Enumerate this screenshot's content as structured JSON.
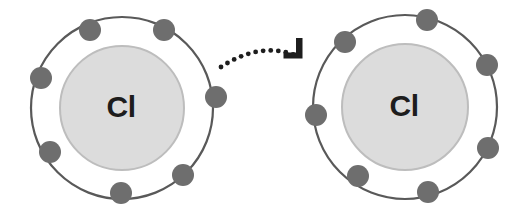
{
  "diagram": {
    "background_color": "#ffffff",
    "width": 532,
    "height": 218
  },
  "style": {
    "shell_stroke_color": "#595959",
    "shell_stroke_width": 2.2,
    "electron_fill_color": "#6e6e6e",
    "electron_radius": 11,
    "nucleus_fill_color": "#dcdcdc",
    "nucleus_stroke_color": "#bdbdbd",
    "nucleus_stroke_width": 2,
    "label_color": "#1d1d1d",
    "arrow_color": "#1d1d1d"
  },
  "atoms": [
    {
      "id": "atom-left",
      "name": "chlorine-atom-left",
      "element_symbol": "Cl",
      "element_name": "Chlorine",
      "center_x": 122,
      "center_y": 108,
      "shell_radius": 91,
      "nucleus_radius": 62,
      "valence_electron_count": 7,
      "electrons": [
        {
          "name": "electron-1",
          "x": 90,
          "y": 30
        },
        {
          "name": "electron-2",
          "x": 164,
          "y": 30
        },
        {
          "name": "electron-3",
          "x": 41,
          "y": 78
        },
        {
          "name": "electron-4",
          "x": 216,
          "y": 97
        },
        {
          "name": "electron-5",
          "x": 50,
          "y": 152
        },
        {
          "name": "electron-6",
          "x": 183,
          "y": 175
        },
        {
          "name": "electron-7",
          "x": 121,
          "y": 193
        }
      ]
    },
    {
      "id": "atom-right",
      "name": "chlorine-atom-right",
      "element_symbol": "Cl",
      "element_name": "Chlorine",
      "center_x": 405,
      "center_y": 107,
      "shell_radius": 92,
      "nucleus_radius": 63,
      "valence_electron_count": 7,
      "electrons": [
        {
          "name": "electron-1",
          "x": 345,
          "y": 42
        },
        {
          "name": "electron-2",
          "x": 427,
          "y": 20
        },
        {
          "name": "electron-3",
          "x": 487,
          "y": 65
        },
        {
          "name": "electron-4",
          "x": 316,
          "y": 115
        },
        {
          "name": "electron-5",
          "x": 488,
          "y": 148
        },
        {
          "name": "electron-6",
          "x": 358,
          "y": 176
        },
        {
          "name": "electron-7",
          "x": 428,
          "y": 192
        }
      ]
    }
  ],
  "transfer_arrow": {
    "name": "electron-transfer-arrow",
    "style": "dotted-curved",
    "direction": "left-to-right",
    "path": "M 221 67 Q 262 40 300 57",
    "dot_radius": 2.4,
    "dot_spacing": 7.6,
    "arrowhead": {
      "description": "angular L-shaped chevron pointing down-right",
      "points": "296 38 302.5 38 302.5 58.5 283.5 58.5 283.5 52.5 296 52.5",
      "tip_x": 302,
      "tip_y": 58
    }
  }
}
